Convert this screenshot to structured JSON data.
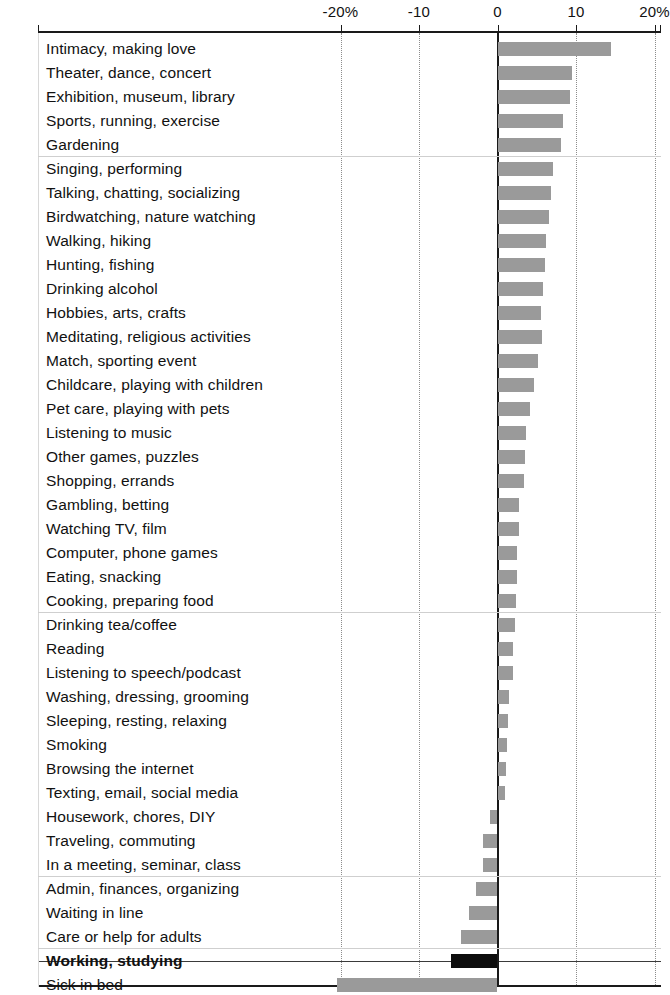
{
  "axis": {
    "tick_labels": [
      "-20%",
      "-10",
      "0",
      "10",
      "20%"
    ],
    "tick_values": [
      -20,
      -10,
      0,
      10,
      20
    ]
  },
  "colors": {
    "bar_positive": "#9a9a9a",
    "bar_negative": "#9a9a9a",
    "bar_highlight": "#0d0d0d",
    "axis": "#1a1a1a",
    "gridline": "#8c8c8c",
    "background": "#ffffff"
  },
  "chart_data": {
    "type": "bar",
    "orientation": "horizontal",
    "title": "",
    "xlabel": "",
    "ylabel": "",
    "xlim": [
      -22.5,
      21.5
    ],
    "grid": true,
    "legend": null,
    "axis_ticks": [
      -20,
      -10,
      0,
      10,
      20
    ],
    "axis_tick_labels": [
      "-20%",
      "-10",
      "0",
      "10",
      "20%"
    ],
    "categories": [
      "Intimacy, making love",
      "Theater, dance, concert",
      "Exhibition, museum, library",
      "Sports, running, exercise",
      "Gardening",
      "Singing, performing",
      "Talking, chatting, socializing",
      "Birdwatching, nature watching",
      "Walking, hiking",
      "Hunting, fishing",
      "Drinking alcohol",
      "Hobbies, arts, crafts",
      "Meditating, religious activities",
      "Match, sporting event",
      "Childcare, playing with children",
      "Pet care, playing with pets",
      "Listening to music",
      "Other games, puzzles",
      "Shopping, errands",
      "Gambling, betting",
      "Watching TV, film",
      "Computer, phone games",
      "Eating, snacking",
      "Cooking, preparing food",
      "Drinking tea/coffee",
      "Reading",
      "Listening to speech/podcast",
      "Washing, dressing, grooming",
      "Sleeping, resting, relaxing",
      "Smoking",
      "Browsing the internet",
      "Texting, email, social media",
      "Housework, chores, DIY",
      "Traveling, commuting",
      "In a meeting, seminar, class",
      "Admin, finances, organizing",
      "Waiting in line",
      "Care or help for adults",
      "Working, studying",
      "Sick in bed"
    ],
    "values": [
      14.4,
      9.5,
      9.2,
      8.4,
      8.1,
      7.1,
      6.8,
      6.6,
      6.2,
      6.0,
      5.8,
      5.6,
      5.7,
      5.1,
      4.6,
      4.1,
      3.6,
      3.5,
      3.4,
      2.8,
      2.7,
      2.5,
      2.5,
      2.4,
      2.2,
      2.0,
      2.0,
      1.5,
      1.3,
      1.2,
      1.1,
      1.0,
      -1.0,
      -1.9,
      -1.9,
      -2.7,
      -3.6,
      -4.6,
      -5.9,
      -20.5
    ],
    "highlighted_categories": [
      "Working, studying"
    ],
    "separators_after": [
      "Gardening",
      "Cooking, preparing food",
      "In a meeting, seminar, class",
      "Care or help for adults"
    ]
  }
}
